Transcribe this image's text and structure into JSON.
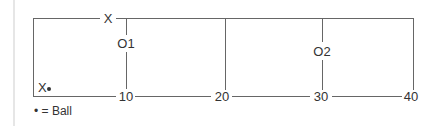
{
  "diagram": {
    "field": {
      "line_color": "#555555",
      "yard_markers": [
        "10",
        "20",
        "30",
        "40"
      ]
    },
    "players": {
      "offense_top": "X",
      "offense_ball_carrier": "X",
      "defender_1": "O1",
      "defender_2": "O2"
    },
    "legend": {
      "symbol": "•",
      "text": "= Ball"
    }
  }
}
